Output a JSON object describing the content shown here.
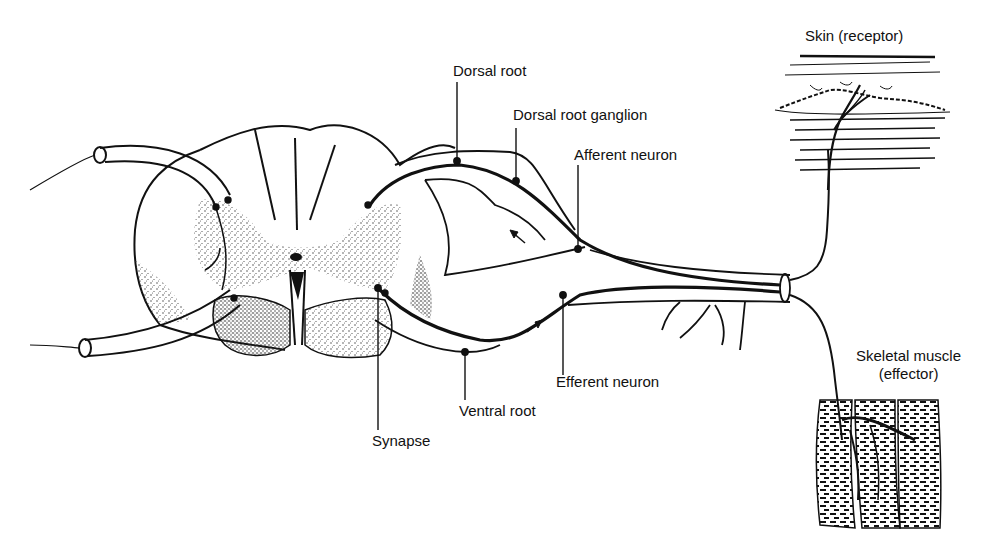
{
  "figure": {
    "type": "reflex-arc-diagram"
  },
  "labels": {
    "dorsal_root": "Dorsal root",
    "dorsal_root_ganglion": "Dorsal root ganglion",
    "afferent_neuron": "Afferent neuron",
    "skin_receptor": "Skin (receptor)",
    "skeletal_muscle_line1": "Skeletal muscle",
    "skeletal_muscle_line2": "(effector)",
    "efferent_neuron": "Efferent neuron",
    "ventral_root": "Ventral root",
    "synapse": "Synapse"
  },
  "colors": {
    "ink": "#111111",
    "background": "#ffffff",
    "stipple": "#555555"
  }
}
